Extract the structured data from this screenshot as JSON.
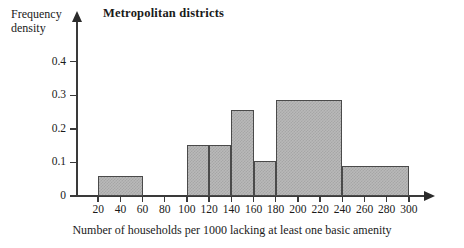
{
  "chart_data": {
    "type": "bar",
    "title": "Metropolitan districts",
    "xlabel": "Number of households per 1000 lacking at least one basic amenity",
    "ylabel": "Frequency density",
    "ylabel_lines": [
      "Frequency",
      "density"
    ],
    "xlim": [
      0,
      310
    ],
    "ylim": [
      0,
      0.45
    ],
    "grid": false,
    "legend": null,
    "xticks": [
      20,
      40,
      60,
      80,
      100,
      120,
      140,
      160,
      180,
      200,
      220,
      240,
      260,
      280,
      300
    ],
    "xtick_labels": [
      "20",
      "40",
      "60",
      "80",
      "100",
      "120",
      "140",
      "160",
      "180",
      "200",
      "220",
      "240",
      "260",
      "280",
      "300"
    ],
    "yticks": [
      0,
      0.1,
      0.2,
      0.3,
      0.4
    ],
    "ytick_labels": [
      "0",
      "0.1",
      "0.2",
      "0.3",
      "0.4"
    ],
    "bins": [
      {
        "label": "20-60",
        "start": 20,
        "end": 60,
        "value": 0.06
      },
      {
        "label": "100-120",
        "start": 100,
        "end": 120,
        "value": 0.152
      },
      {
        "label": "120-140",
        "start": 120,
        "end": 140,
        "value": 0.153
      },
      {
        "label": "140-160",
        "start": 140,
        "end": 160,
        "value": 0.255
      },
      {
        "label": "160-180",
        "start": 160,
        "end": 180,
        "value": 0.103
      },
      {
        "label": "180-240",
        "start": 180,
        "end": 240,
        "value": 0.285
      },
      {
        "label": "240-300",
        "start": 240,
        "end": 300,
        "value": 0.088
      }
    ],
    "bar_fill_color": "#b9b9b9",
    "bar_edge_color": "#4a4a4a",
    "axis_color": "#3a3a3a"
  }
}
